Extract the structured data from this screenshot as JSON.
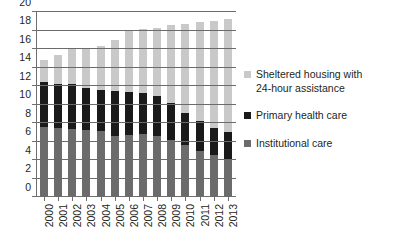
{
  "chart_data": {
    "type": "bar",
    "stacked": true,
    "title": "",
    "xlabel": "",
    "ylabel": "",
    "ylim": [
      0,
      20
    ],
    "ytick_step": 2,
    "yticks": [
      0,
      2,
      4,
      6,
      8,
      10,
      12,
      14,
      16,
      18,
      20
    ],
    "grid": true,
    "legend_position": "right",
    "categories": [
      "2000",
      "2001",
      "2002",
      "2003",
      "2004",
      "2005",
      "2006",
      "2007",
      "2008",
      "2009",
      "2010",
      "2011",
      "2012",
      "2013"
    ],
    "series": [
      {
        "name": "Institutional care",
        "color": "#6b6b6b",
        "values": [
          7.6,
          7.5,
          7.4,
          7.2,
          7.1,
          6.6,
          6.7,
          6.8,
          6.6,
          6.2,
          5.6,
          5.0,
          4.5,
          4.0
        ]
      },
      {
        "name": "Primary health care",
        "color": "#1a1a1a",
        "values": [
          4.8,
          4.7,
          4.8,
          4.6,
          4.5,
          4.9,
          4.7,
          4.4,
          4.3,
          4.0,
          3.5,
          3.2,
          3.0,
          3.0
        ]
      },
      {
        "name": "Sheltered housing with 24-hour assistance",
        "color": "#c9c9c9",
        "values": [
          2.4,
          3.1,
          3.8,
          4.2,
          4.7,
          5.5,
          6.6,
          7.0,
          7.4,
          8.4,
          9.6,
          10.7,
          11.5,
          12.2
        ]
      }
    ],
    "totals": [
      14.8,
      15.3,
      16.0,
      16.0,
      16.3,
      17.0,
      18.0,
      18.2,
      18.3,
      18.6,
      18.7,
      18.9,
      19.0,
      19.2
    ]
  },
  "legend": {
    "items": [
      {
        "label_line1": "Sheltered housing with",
        "label_line2": "24-hour assistance",
        "color": "#c9c9c9"
      },
      {
        "label_line1": "Primary health care",
        "label_line2": "",
        "color": "#1a1a1a"
      },
      {
        "label_line1": "Institutional care",
        "label_line2": "",
        "color": "#6b6b6b"
      }
    ]
  }
}
